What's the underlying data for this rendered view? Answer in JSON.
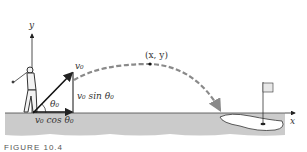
{
  "diagram": {
    "axes": {
      "x_label": "x",
      "y_label": "y"
    },
    "vectors": {
      "initial_velocity_label": "v₀",
      "vertical_component_label": "v₀ sin θ₀",
      "horizontal_component_label": "v₀ cos θ₀",
      "angle_label": "θ₀"
    },
    "trajectory": {
      "point_label": "(x, y)",
      "style": "dashed"
    },
    "objects": [
      "golfer",
      "golf-green",
      "flag"
    ],
    "colors": {
      "ground": "#c8c8c8",
      "trajectory": "#8a8a8a",
      "ink": "#222222"
    }
  },
  "caption": "FIGURE 10.4"
}
